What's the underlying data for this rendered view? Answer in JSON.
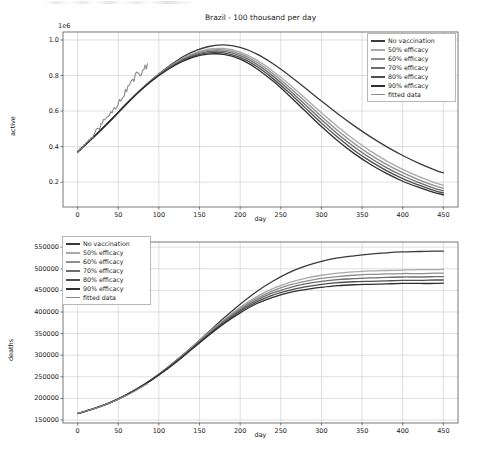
{
  "figure": {
    "width": 483,
    "height": 464,
    "background": "#ffffff"
  },
  "chart_data": [
    {
      "type": "line",
      "id": "active-cases",
      "title": "Brazil - 100 thousand per day",
      "xlabel": "day",
      "ylabel": "active",
      "y_offset_text": "1e6",
      "y_scale": 1000000,
      "xlim": [
        -18,
        468
      ],
      "ylim": [
        60000,
        1045000
      ],
      "xticks": [
        0,
        50,
        100,
        150,
        200,
        250,
        300,
        350,
        400,
        450
      ],
      "xticklabels": [
        "0",
        "50",
        "100",
        "150",
        "200",
        "250",
        "300",
        "350",
        "400",
        "450"
      ],
      "yticks": [
        0.2,
        0.4,
        0.6,
        0.8,
        1.0
      ],
      "yticklabels": [
        "0.2",
        "0.4",
        "0.6",
        "0.8",
        "1.0"
      ],
      "grid": true,
      "legend_position": "upper right",
      "x": [
        0,
        20,
        40,
        60,
        80,
        100,
        120,
        140,
        160,
        180,
        200,
        220,
        240,
        260,
        280,
        300,
        320,
        340,
        360,
        380,
        400,
        420,
        440,
        450
      ],
      "series": [
        {
          "name": "No vaccination",
          "color": "#3a3a3a",
          "linewidth": 1.3,
          "values": [
            370000,
            455000,
            545000,
            640000,
            730000,
            810000,
            878000,
            930000,
            962000,
            972000,
            958000,
            922000,
            868000,
            802000,
            730000,
            656000,
            585000,
            518000,
            456000,
            400000,
            350000,
            306000,
            268000,
            252000
          ]
        },
        {
          "name": "50% efficacy",
          "color": "#a9a9a9",
          "linewidth": 1.3,
          "values": [
            370000,
            455000,
            545000,
            640000,
            730000,
            808000,
            872000,
            920000,
            948000,
            952000,
            932000,
            888000,
            826000,
            752000,
            672000,
            590000,
            512000,
            440000,
            376000,
            320000,
            272000,
            231000,
            196000,
            182000
          ]
        },
        {
          "name": "60% efficacy",
          "color": "#8e8e8e",
          "linewidth": 1.3,
          "values": [
            370000,
            455000,
            545000,
            640000,
            729000,
            806000,
            869000,
            915000,
            941000,
            944000,
            922000,
            876000,
            812000,
            736000,
            654000,
            570000,
            491000,
            419000,
            355000,
            300000,
            253000,
            213000,
            179000,
            166000
          ]
        },
        {
          "name": "70% efficacy",
          "color": "#6d6d6d",
          "linewidth": 1.3,
          "values": [
            370000,
            455000,
            545000,
            640000,
            729000,
            804000,
            866000,
            910000,
            934000,
            936000,
            912000,
            864000,
            798000,
            720000,
            636000,
            551000,
            471000,
            399000,
            336000,
            282000,
            236000,
            197000,
            164000,
            152000
          ]
        },
        {
          "name": "80% efficacy",
          "color": "#4e4e4e",
          "linewidth": 1.3,
          "values": [
            370000,
            455000,
            545000,
            640000,
            728000,
            802000,
            862000,
            905000,
            927000,
            928000,
            902000,
            852000,
            784000,
            704000,
            618000,
            532000,
            452000,
            380000,
            318000,
            265000,
            220000,
            183000,
            151000,
            140000
          ]
        },
        {
          "name": "90% efficacy",
          "color": "#2f2f2f",
          "linewidth": 1.3,
          "values": [
            370000,
            455000,
            545000,
            640000,
            727000,
            800000,
            858000,
            899000,
            920000,
            919000,
            892000,
            840000,
            770000,
            688000,
            600000,
            513000,
            433000,
            362000,
            301000,
            249000,
            205000,
            170000,
            139000,
            129000
          ]
        },
        {
          "name": "fitted data",
          "color": "#8a8a8a",
          "linewidth": 1.1,
          "noisy": true,
          "x_end": 86,
          "values": [
            372000,
            452000,
            556000,
            658000,
            782000,
            848000
          ]
        }
      ]
    },
    {
      "type": "line",
      "id": "cumulative-deaths",
      "title": "",
      "xlabel": "day",
      "ylabel": "deaths",
      "xlim": [
        -18,
        468
      ],
      "ylim": [
        143000,
        562000
      ],
      "xticks": [
        0,
        50,
        100,
        150,
        200,
        250,
        300,
        350,
        400,
        450
      ],
      "xticklabels": [
        "0",
        "50",
        "100",
        "150",
        "200",
        "250",
        "300",
        "350",
        "400",
        "450"
      ],
      "yticks": [
        150000,
        200000,
        250000,
        300000,
        350000,
        400000,
        450000,
        500000,
        550000
      ],
      "yticklabels": [
        "150000",
        "200000",
        "250000",
        "300000",
        "350000",
        "400000",
        "450000",
        "500000",
        "550000"
      ],
      "grid": true,
      "legend_position": "upper left",
      "x": [
        0,
        20,
        40,
        60,
        80,
        100,
        120,
        140,
        160,
        180,
        200,
        220,
        240,
        260,
        280,
        300,
        320,
        340,
        360,
        380,
        400,
        420,
        440,
        450
      ],
      "series": [
        {
          "name": "No vaccination",
          "color": "#3a3a3a",
          "linewidth": 1.3,
          "values": [
            165000,
            176000,
            190000,
            208000,
            230000,
            256000,
            286000,
            318000,
            352000,
            386000,
            418000,
            447000,
            471000,
            491000,
            506000,
            517000,
            525000,
            530000,
            534000,
            537000,
            539000,
            540000,
            541000,
            541000
          ]
        },
        {
          "name": "50% efficacy",
          "color": "#a9a9a9",
          "linewidth": 1.3,
          "values": [
            165000,
            176000,
            190000,
            208000,
            230000,
            256000,
            285000,
            317000,
            350000,
            382000,
            411000,
            435000,
            454000,
            468000,
            478000,
            485000,
            490000,
            493000,
            495000,
            496000,
            497000,
            498000,
            498000,
            499000
          ]
        },
        {
          "name": "60% efficacy",
          "color": "#8e8e8e",
          "linewidth": 1.3,
          "values": [
            165000,
            176000,
            190000,
            208000,
            230000,
            256000,
            285000,
            316000,
            349000,
            380000,
            408000,
            431000,
            449000,
            462000,
            471000,
            478000,
            482000,
            485000,
            487000,
            488000,
            489000,
            489000,
            490000,
            490000
          ]
        },
        {
          "name": "70% efficacy",
          "color": "#6d6d6d",
          "linewidth": 1.3,
          "values": [
            165000,
            176000,
            190000,
            208000,
            230000,
            255000,
            284000,
            315000,
            347000,
            378000,
            405000,
            427000,
            444000,
            456000,
            465000,
            471000,
            475000,
            477000,
            479000,
            480000,
            481000,
            481000,
            482000,
            482000
          ]
        },
        {
          "name": "80% efficacy",
          "color": "#4e4e4e",
          "linewidth": 1.3,
          "values": [
            165000,
            176000,
            190000,
            208000,
            229000,
            255000,
            283000,
            314000,
            346000,
            375000,
            402000,
            423000,
            439000,
            450000,
            458000,
            464000,
            468000,
            470000,
            471000,
            472000,
            473000,
            473000,
            474000,
            474000
          ]
        },
        {
          "name": "90% efficacy",
          "color": "#2f2f2f",
          "linewidth": 1.3,
          "values": [
            165000,
            176000,
            190000,
            208000,
            229000,
            254000,
            282000,
            313000,
            344000,
            373000,
            398000,
            419000,
            434000,
            445000,
            452000,
            457000,
            461000,
            463000,
            464000,
            465000,
            466000,
            466000,
            466000,
            467000
          ]
        },
        {
          "name": "fitted data",
          "color": "#8a8a8a",
          "linewidth": 1.1,
          "x_end": 86,
          "values": [
            165000,
            177000,
            192000,
            211000,
            234000
          ]
        }
      ]
    }
  ],
  "legend1": {
    "items": [
      {
        "label": "No vaccination",
        "color": "#3a3a3a"
      },
      {
        "label": "50% efficacy",
        "color": "#a9a9a9"
      },
      {
        "label": "60% efficacy",
        "color": "#8e8e8e"
      },
      {
        "label": "70% efficacy",
        "color": "#6d6d6d"
      },
      {
        "label": "80% efficacy",
        "color": "#4e4e4e"
      },
      {
        "label": "90% efficacy",
        "color": "#2f2f2f"
      },
      {
        "label": "fitted data",
        "color": "#8a8a8a"
      }
    ]
  },
  "legend2": {
    "items": [
      {
        "label": "No vaccination",
        "color": "#3a3a3a"
      },
      {
        "label": "50% efficacy",
        "color": "#a9a9a9"
      },
      {
        "label": "60% efficacy",
        "color": "#8e8e8e"
      },
      {
        "label": "70% efficacy",
        "color": "#6d6d6d"
      },
      {
        "label": "80% efficacy",
        "color": "#4e4e4e"
      },
      {
        "label": "90% efficacy",
        "color": "#2f2f2f"
      },
      {
        "label": "fitted data",
        "color": "#8a8a8a"
      }
    ]
  }
}
